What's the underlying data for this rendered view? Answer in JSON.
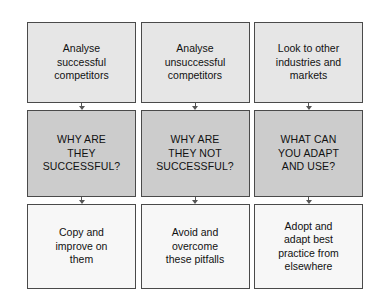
{
  "diagram": {
    "type": "flowchart",
    "title": "",
    "background_color": "#ffffff",
    "row_colors": {
      "analyse": "#e6e6e6",
      "question": "#cccccc",
      "action": "#f7f7f7"
    },
    "border_color": "#4a4a4a",
    "arrow_color": "#555555",
    "rows": [
      "analyse",
      "question",
      "action"
    ],
    "columns": [
      {
        "id": "successful-competitors",
        "analyse": "Analyse\nsuccessful\ncompetitors",
        "question": "WHY ARE\nTHEY\nSUCCESSFUL?",
        "action": "Copy and\nimprove on\nthem"
      },
      {
        "id": "unsuccessful-competitors",
        "analyse": "Analyse\nunsuccessful\ncompetitors",
        "question": "WHY ARE\nTHEY NOT\nSUCCESSFUL?",
        "action": "Avoid and\novercome\nthese pitfalls"
      },
      {
        "id": "other-industries",
        "analyse": "Look to other\nindustries and\nmarkets",
        "question": "WHAT CAN\nYOU ADAPT\nAND USE?",
        "action": "Adopt and\nadapt best\npractice from\nelsewhere"
      }
    ],
    "connectors": [
      {
        "id": "col1-analyse-to-question",
        "icon": "down-arrow-icon"
      },
      {
        "id": "col1-question-to-action",
        "icon": "down-arrow-icon"
      },
      {
        "id": "col2-analyse-to-question",
        "icon": "down-arrow-icon"
      },
      {
        "id": "col2-question-to-action",
        "icon": "down-arrow-icon"
      },
      {
        "id": "col3-analyse-to-question",
        "icon": "down-arrow-icon"
      },
      {
        "id": "col3-question-to-action",
        "icon": "down-arrow-icon"
      }
    ]
  }
}
